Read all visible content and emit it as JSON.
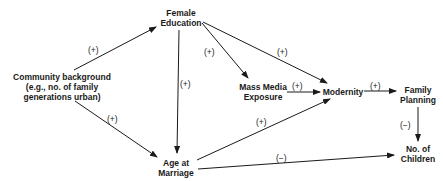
{
  "nodes": {
    "community": {
      "line1": "Community background",
      "line2": "(e.g., no. of family",
      "line3": "generations urban)"
    },
    "female_education": {
      "line1": "Female",
      "line2": "Education"
    },
    "mass_media": {
      "line1": "Mass Media",
      "line2": "Exposure"
    },
    "modernity": {
      "line1": "Modernity"
    },
    "family_planning": {
      "line1": "Family",
      "line2": "Planning"
    },
    "age_at_marriage": {
      "line1": "Age at",
      "line2": "Marriage"
    },
    "children": {
      "line1": "No. of",
      "line2": "Children"
    }
  },
  "edges": [
    {
      "from": "Community background",
      "to": "Female Education",
      "sign": "(+)"
    },
    {
      "from": "Community background",
      "to": "Age at Marriage",
      "sign": "(+)"
    },
    {
      "from": "Female Education",
      "to": "Age at Marriage",
      "sign": "(+)"
    },
    {
      "from": "Female Education",
      "to": "Mass Media Exposure",
      "sign": "(+)"
    },
    {
      "from": "Female Education",
      "to": "Modernity",
      "sign": "(+)"
    },
    {
      "from": "Mass Media Exposure",
      "to": "Modernity",
      "sign": "(+)"
    },
    {
      "from": "Age at Marriage",
      "to": "Modernity",
      "sign": "(+)"
    },
    {
      "from": "Modernity",
      "to": "Family Planning",
      "sign": "(+)"
    },
    {
      "from": "Family Planning",
      "to": "No. of Children",
      "sign": "(−)"
    },
    {
      "from": "Age at Marriage",
      "to": "No. of Children",
      "sign": "(−)"
    }
  ]
}
